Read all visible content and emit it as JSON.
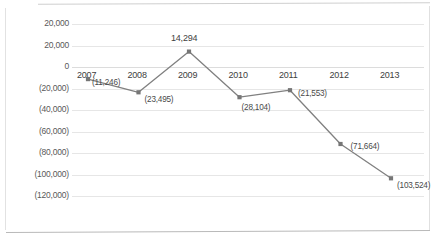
{
  "chart_data": {
    "type": "line",
    "title": "",
    "xlabel": "",
    "ylabel": "",
    "categories": [
      "2007",
      "2008",
      "2009",
      "2010",
      "2011",
      "2012",
      "2013"
    ],
    "values": [
      -11246,
      -23495,
      14294,
      -28104,
      -21553,
      -71664,
      -103524
    ],
    "point_labels": [
      "(11,246)",
      "(23,495)",
      "14,294",
      "(28,104)",
      "(21,553)",
      "(71,664)",
      "(103,524)"
    ],
    "ytick_labels": [
      "20,000",
      "20,000",
      "0",
      "(20,000)",
      "(40,000)",
      "(60,000)",
      "(80,000)",
      "(100,000)",
      "(120,000)"
    ],
    "ytick_values": [
      40000,
      20000,
      0,
      -20000,
      -40000,
      -60000,
      -80000,
      -100000,
      -120000
    ],
    "ylim": [
      -130000,
      40000
    ],
    "grid": true,
    "legend": "none",
    "series_color": "#808080",
    "marker": "square",
    "gridline_color": "#e6e6e6"
  }
}
